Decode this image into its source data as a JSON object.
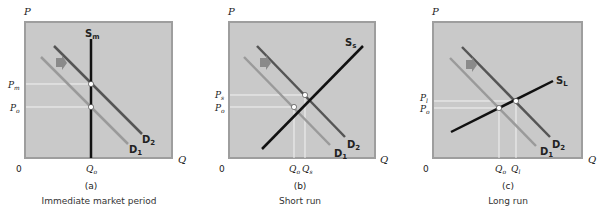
{
  "figure": {
    "colors": {
      "plot_bg": "#c9c9c9",
      "plot_border": "#9e9e9e",
      "supply": "#111111",
      "demand_new": "#555555",
      "demand_old": "#9a9a9a",
      "guide": "#f2f2f2",
      "arrow": "#8a8a8a"
    },
    "panels": [
      {
        "id": "a",
        "panel_label": "(a)",
        "caption": "Immediate market period",
        "y_axis": "P",
        "x_axis": "Q",
        "origin": "0",
        "supply": {
          "label": "S",
          "sub": "m"
        },
        "demand_new": {
          "label": "D",
          "sub": "2"
        },
        "demand_old": {
          "label": "D",
          "sub": "1"
        },
        "price_high": {
          "label": "P",
          "sub": "m"
        },
        "price_low": {
          "label": "P",
          "sub": "o"
        },
        "qty_a": {
          "label": "Q",
          "sub": "o"
        }
      },
      {
        "id": "b",
        "panel_label": "(b)",
        "caption": "Short run",
        "y_axis": "P",
        "x_axis": "Q",
        "origin": "0",
        "supply": {
          "label": "S",
          "sub": "s"
        },
        "demand_new": {
          "label": "D",
          "sub": "2"
        },
        "demand_old": {
          "label": "D",
          "sub": "1"
        },
        "price_high": {
          "label": "P",
          "sub": "s"
        },
        "price_low": {
          "label": "P",
          "sub": "o"
        },
        "qty_a": {
          "label": "Q",
          "sub": "o"
        },
        "qty_b": {
          "label": "Q",
          "sub": "s"
        }
      },
      {
        "id": "c",
        "panel_label": "(c)",
        "caption": "Long run",
        "y_axis": "P",
        "x_axis": "Q",
        "origin": "0",
        "supply": {
          "label": "S",
          "sub": "L"
        },
        "demand_new": {
          "label": "D",
          "sub": "2"
        },
        "demand_old": {
          "label": "D",
          "sub": "1"
        },
        "price_high": {
          "label": "P",
          "sub": "l"
        },
        "price_low": {
          "label": "P",
          "sub": "o"
        },
        "qty_a": {
          "label": "Q",
          "sub": "o"
        },
        "qty_b": {
          "label": "Q",
          "sub": "l"
        }
      }
    ]
  }
}
